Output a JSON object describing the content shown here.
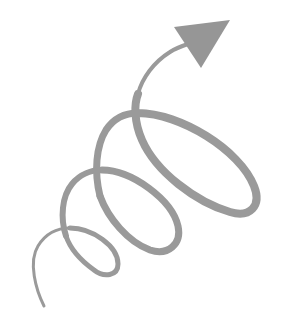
{
  "illustration": {
    "subject": "spiral-arrow",
    "description": "Grey looping spiral line rising from lower-left and ending in a triangular arrowhead pointing to upper-right",
    "colors": {
      "background": "#ffffff",
      "stroke": "#9a9a9a",
      "arrowhead": "#969696"
    },
    "loops": 3,
    "direction": "up-right"
  }
}
